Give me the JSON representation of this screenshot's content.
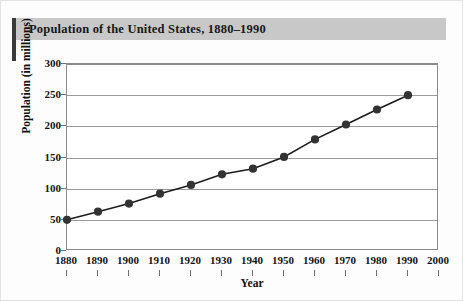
{
  "chart_data": {
    "type": "line",
    "title": "Population of the United States, 1880–1990",
    "xlabel": "Year",
    "ylabel": "Population (in millions)",
    "x": [
      1880,
      1890,
      1900,
      1910,
      1920,
      1930,
      1940,
      1950,
      1960,
      1970,
      1980,
      1990
    ],
    "values": [
      50,
      63,
      76,
      92,
      106,
      123,
      132,
      151,
      179,
      203,
      227,
      250
    ],
    "series": [
      {
        "name": "Population (in millions)",
        "values": [
          50,
          63,
          76,
          92,
          106,
          123,
          132,
          151,
          179,
          203,
          227,
          250
        ]
      }
    ],
    "xlim": [
      1880,
      2000
    ],
    "ylim": [
      0,
      300
    ],
    "xticks": [
      1880,
      1890,
      1900,
      1910,
      1920,
      1930,
      1940,
      1950,
      1960,
      1970,
      1980,
      1990,
      2000
    ],
    "xtick_labels": [
      "1880",
      "1890",
      "1900",
      "1910",
      "1920",
      "1930",
      "1940",
      "1950",
      "1960",
      "1970",
      "1980",
      "1990",
      "2000"
    ],
    "yticks": [
      0,
      50,
      100,
      150,
      200,
      250,
      300
    ],
    "ytick_labels": [
      "0",
      "50",
      "100",
      "150",
      "200",
      "250",
      "300"
    ],
    "grid": "horizontal",
    "legend": "none",
    "marker": "filled-circle",
    "line_color": "#1c1c1c",
    "marker_color": "#333333",
    "grid_color": "#9a9a9a",
    "banner_color": "#c8c8c8",
    "accent_color": "#3a3a3a"
  }
}
